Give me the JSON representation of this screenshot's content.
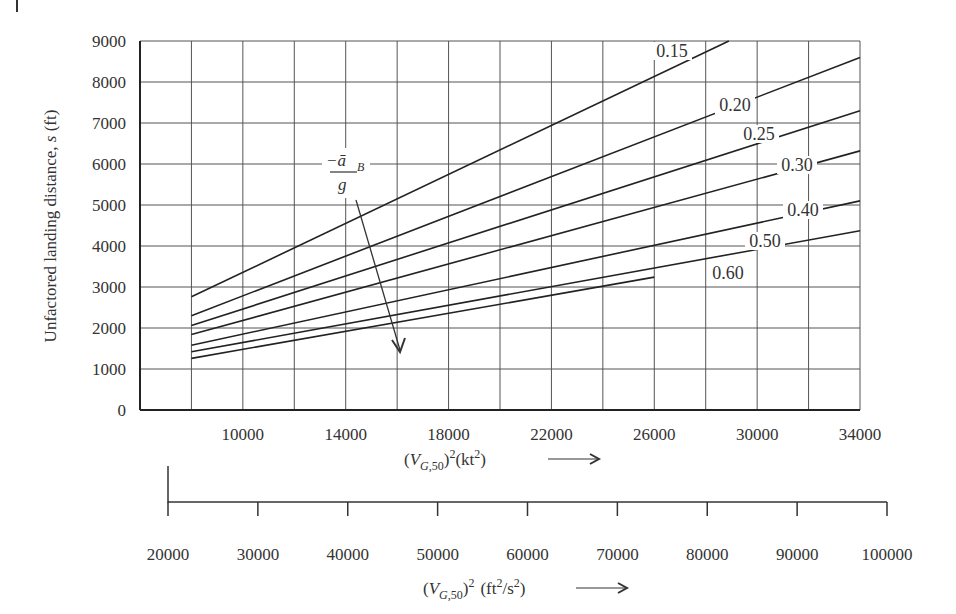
{
  "chart_data": {
    "type": "line",
    "title": "",
    "xlabel": "(V_G,50)^2 (kt^2)",
    "ylabel": "Unfactored landing distance, s (ft)",
    "xlim": [
      6000,
      34000
    ],
    "ylim": [
      0,
      9000
    ],
    "grid": true,
    "x_ticks": [
      10000,
      14000,
      18000,
      22000,
      26000,
      30000,
      34000
    ],
    "x_tick_labels": [
      "10000",
      "14000",
      "18000",
      "22000",
      "26000",
      "30000",
      "34000"
    ],
    "y_ticks": [
      0,
      1000,
      2000,
      3000,
      4000,
      5000,
      6000,
      7000,
      8000,
      9000
    ],
    "y_tick_labels": [
      "0",
      "1000",
      "2000",
      "3000",
      "4000",
      "5000",
      "6000",
      "7000",
      "8000",
      "9000"
    ],
    "secondary_x_axis": {
      "label": "(V_G,50)^2 (ft^2/s^2)",
      "range": [
        20000,
        100000
      ],
      "ticks": [
        "20000",
        "30000",
        "40000",
        "50000",
        "60000",
        "70000",
        "80000",
        "90000",
        "100000"
      ]
    },
    "parameter_annotation": "-ā_B / g",
    "series": [
      {
        "name": "0.15",
        "x": [
          8000,
          28900
        ],
        "values": [
          2760,
          9000
        ]
      },
      {
        "name": "0.20",
        "x": [
          8000,
          34000
        ],
        "values": [
          2300,
          8600
        ]
      },
      {
        "name": "0.25",
        "x": [
          8000,
          34000
        ],
        "values": [
          2060,
          7300
        ]
      },
      {
        "name": "0.30",
        "x": [
          8000,
          34000
        ],
        "values": [
          1840,
          6320
        ]
      },
      {
        "name": "0.40",
        "x": [
          8000,
          34000
        ],
        "values": [
          1580,
          5100
        ]
      },
      {
        "name": "0.50",
        "x": [
          8000,
          34000
        ],
        "values": [
          1420,
          4370
        ]
      },
      {
        "name": "0.60",
        "x": [
          8000,
          26000
        ],
        "values": [
          1260,
          3240
        ]
      }
    ]
  },
  "labels": {
    "ylabel_main": "Unfactored landing distance, ",
    "ylabel_var": "s",
    "ylabel_unit": " (ft)",
    "xlabel_kt_unit": "(kt",
    "xlabel_fts_unit": "(ft",
    "xlabel_fts_mid": "/s",
    "annot_num": "−ā",
    "annot_sub": "B",
    "annot_den": "g"
  }
}
